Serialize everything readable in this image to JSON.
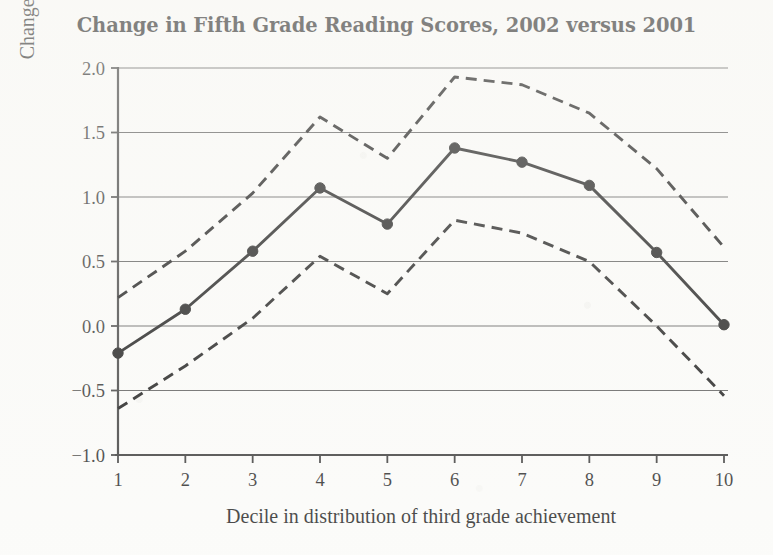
{
  "chart_data": {
    "type": "line",
    "title": "Change in Fifth Grade Reading Scores, 2002 versus 2001",
    "xlabel": "Decile in distribution of third grade achievement",
    "ylabel": "Change in ISAT scale score",
    "x": [
      1,
      2,
      3,
      4,
      5,
      6,
      7,
      8,
      9,
      10
    ],
    "xtick_labels": [
      "1",
      "2",
      "3",
      "4",
      "5",
      "6",
      "7",
      "8",
      "9",
      "10"
    ],
    "ytick_labels": [
      "2.0",
      "1.5",
      "1.0",
      "0.5",
      "0.0",
      "-0.5",
      "-1.0"
    ],
    "ytick_values": [
      2.0,
      1.5,
      1.0,
      0.5,
      0.0,
      -0.5,
      -1.0
    ],
    "xlim": [
      1,
      10
    ],
    "ylim": [
      -1.0,
      2.0
    ],
    "grid": true,
    "legend": "none",
    "series": [
      {
        "name": "Upper confidence bound",
        "style": "dashed",
        "markers": false,
        "values": [
          0.22,
          0.58,
          1.03,
          1.62,
          1.3,
          1.93,
          1.87,
          1.65,
          1.22,
          0.61
        ]
      },
      {
        "name": "Point estimate",
        "style": "solid",
        "markers": true,
        "values": [
          -0.21,
          0.13,
          0.58,
          1.07,
          0.79,
          1.38,
          1.27,
          1.09,
          0.57,
          0.01
        ]
      },
      {
        "name": "Lower confidence bound",
        "style": "dashed",
        "markers": false,
        "values": [
          -0.64,
          -0.31,
          0.06,
          0.54,
          0.25,
          0.82,
          0.72,
          0.5,
          0.0,
          -0.54
        ]
      }
    ]
  }
}
